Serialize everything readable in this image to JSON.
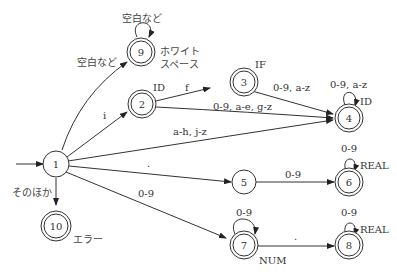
{
  "diagram": {
    "type": "finite-state-automaton",
    "states": [
      {
        "id": "1",
        "label": "1",
        "accepting": false,
        "start": true,
        "token": ""
      },
      {
        "id": "2",
        "label": "2",
        "accepting": true,
        "token": "ID"
      },
      {
        "id": "3",
        "label": "3",
        "accepting": true,
        "token": "IF"
      },
      {
        "id": "4",
        "label": "4",
        "accepting": true,
        "token": "ID"
      },
      {
        "id": "5",
        "label": "5",
        "accepting": false,
        "token": ""
      },
      {
        "id": "6",
        "label": "6",
        "accepting": true,
        "token": "REAL"
      },
      {
        "id": "7",
        "label": "7",
        "accepting": true,
        "token": "NUM"
      },
      {
        "id": "8",
        "label": "8",
        "accepting": true,
        "token": "REAL"
      },
      {
        "id": "9",
        "label": "9",
        "accepting": true,
        "token_line1": "ホワイト",
        "token_line2": "スペース"
      },
      {
        "id": "10",
        "label": "10",
        "accepting": true,
        "token": "エラー"
      }
    ],
    "transitions": [
      {
        "from": "1",
        "to": "9",
        "label": "空白など"
      },
      {
        "from": "9",
        "to": "9",
        "label": "空白など"
      },
      {
        "from": "1",
        "to": "2",
        "label": "i"
      },
      {
        "from": "2",
        "to": "3",
        "label": "f"
      },
      {
        "from": "2",
        "to": "4",
        "label": "0-9, a-e, g-z"
      },
      {
        "from": "3",
        "to": "4",
        "label": "0-9, a-z"
      },
      {
        "from": "4",
        "to": "4",
        "label": "0-9, a-z"
      },
      {
        "from": "1",
        "to": "4",
        "label": "a-h, j-z"
      },
      {
        "from": "1",
        "to": "5",
        "label": "."
      },
      {
        "from": "5",
        "to": "6",
        "label": "0-9"
      },
      {
        "from": "6",
        "to": "6",
        "label": "0-9"
      },
      {
        "from": "1",
        "to": "7",
        "label": "0-9"
      },
      {
        "from": "7",
        "to": "7",
        "label": "0-9"
      },
      {
        "from": "7",
        "to": "8",
        "label": "."
      },
      {
        "from": "8",
        "to": "8",
        "label": "0-9"
      },
      {
        "from": "1",
        "to": "10",
        "label": "そのほか"
      }
    ]
  }
}
